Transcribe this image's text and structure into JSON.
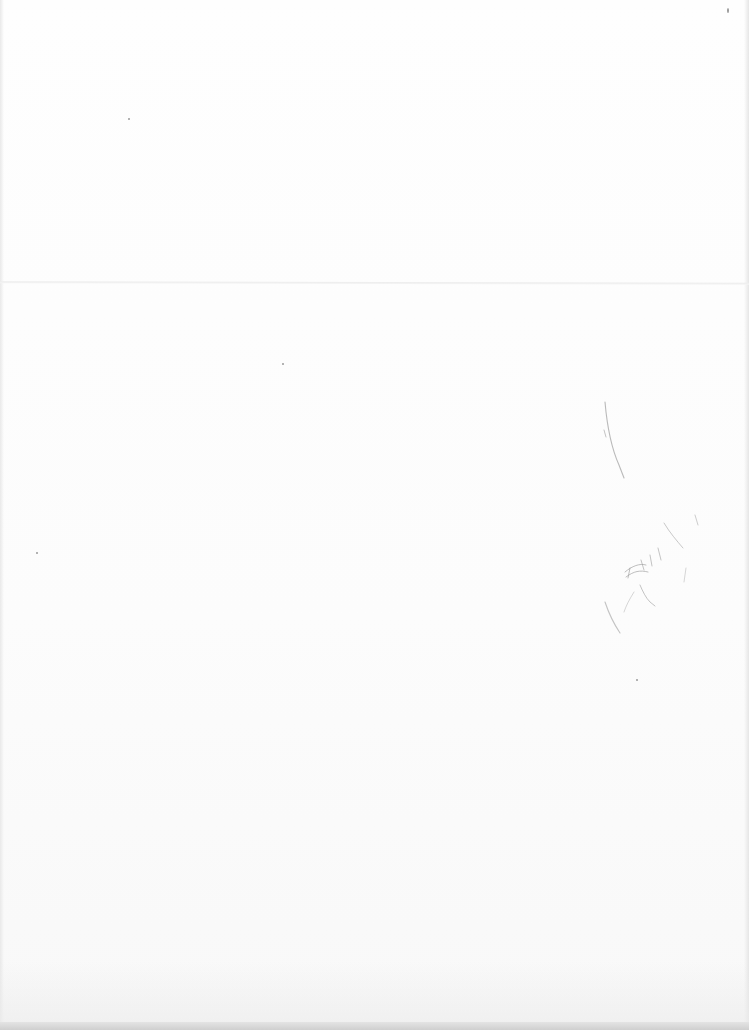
{
  "document": {
    "type": "scanned blank page",
    "paper_color": "#fdfdfd",
    "pencil_color": "#9c9c9c",
    "fold_color": "#ececec",
    "bottom_edge_color": "#d4d4d4",
    "handwriting": {
      "legible_text": null,
      "description": "faint illegible pencil scribbles"
    }
  }
}
